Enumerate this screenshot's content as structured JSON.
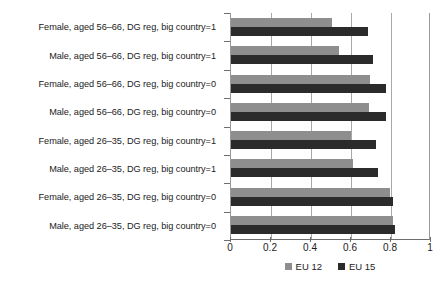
{
  "chart_data": {
    "type": "bar",
    "orientation": "horizontal",
    "title": "",
    "xlabel": "",
    "ylabel": "",
    "xlim": [
      0,
      1
    ],
    "xticks": [
      "0",
      "0.2",
      "0.4",
      "0.6",
      "0.8",
      "1"
    ],
    "xtick_values": [
      0,
      0.2,
      0.4,
      0.6,
      0.8,
      1
    ],
    "grid": true,
    "grid_axis": "x",
    "legend_position": "bottom",
    "categories": [
      "Female, aged 56–66, DG reg, big country=1",
      "Male, aged 56–66, DG reg, big country=1",
      "Female, aged 56–66, DG reg, big country=0",
      "Male, aged 56–66, DG reg, big country=0",
      "Female, aged 26–35, DG reg, big country=1",
      "Male, aged 26–35, DG reg, big country=1",
      "Female, aged 26–35, DG reg, big country=0",
      "Male, aged 26–35, DG reg, big country=0"
    ],
    "series": [
      {
        "name": "EU 12",
        "color": "#8e8e8e",
        "values": [
          0.505,
          0.54,
          0.695,
          0.69,
          0.6,
          0.61,
          0.795,
          0.81
        ]
      },
      {
        "name": "EU 15",
        "color": "#2b2b2b",
        "values": [
          0.685,
          0.71,
          0.775,
          0.775,
          0.725,
          0.735,
          0.81,
          0.82
        ]
      }
    ]
  },
  "legend": {
    "entries": [
      {
        "label": "EU 12",
        "color": "#8e8e8e"
      },
      {
        "label": "EU 15",
        "color": "#2b2b2b"
      }
    ]
  }
}
